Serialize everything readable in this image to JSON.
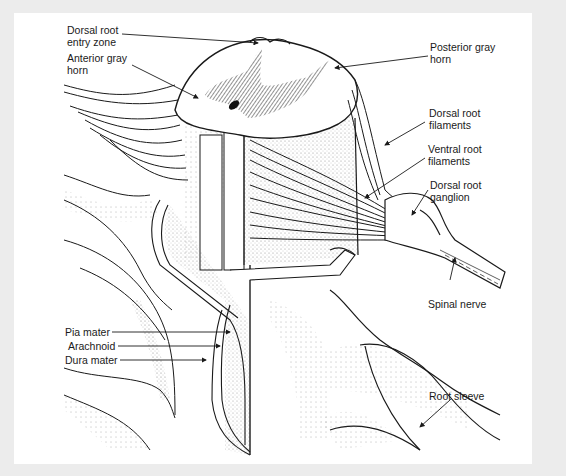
{
  "figure": {
    "colors": {
      "background": "#ececec",
      "canvas": "#ffffff",
      "ink": "#1a1a1a"
    }
  },
  "labels": {
    "dorsal_root_entry_zone": "Dorsal root\nentry zone",
    "anterior_gray_horn": "Anterior gray\nhorn",
    "posterior_gray_horn": "Posterior gray\nhorn",
    "dorsal_root_filaments": "Dorsal root\nfilaments",
    "ventral_root_filaments": "Ventral root\nfilaments",
    "dorsal_root_ganglion": "Dorsal root\nganglion",
    "spinal_nerve": "Spinal nerve",
    "pia_mater": "Pia mater",
    "arachnoid": "Arachnoid",
    "dura_mater": "Dura mater",
    "root_sleeve": "Root sleeve"
  }
}
